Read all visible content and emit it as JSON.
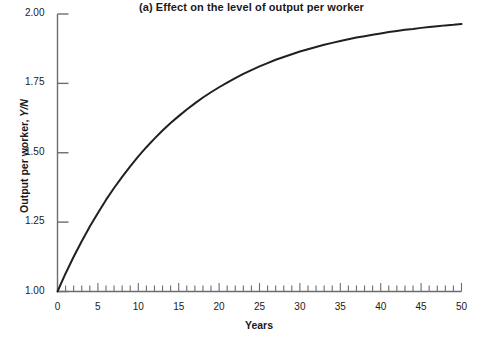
{
  "chart_data": {
    "type": "line",
    "title": "(a) Effect on the level of output per worker",
    "xlabel": "Years",
    "ylabel": "Output per worker, Y/N",
    "ylabel_plain": "Output per worker, ",
    "ylabel_italic": "Y/N",
    "xlim": [
      0,
      50
    ],
    "ylim": [
      1.0,
      2.0
    ],
    "grid": false,
    "legend": null,
    "xticks": [
      0,
      5,
      10,
      15,
      20,
      25,
      30,
      35,
      40,
      45,
      50
    ],
    "xtick_labels": [
      "0",
      "5",
      "10",
      "15",
      "20",
      "25",
      "30",
      "35",
      "40",
      "45",
      "50"
    ],
    "xminor_tick_step": 1,
    "yticks": [
      1.0,
      1.25,
      1.5,
      1.75,
      2.0
    ],
    "ytick_labels": [
      "1.00",
      "1.25",
      "1.50",
      "1.75",
      "2.00"
    ],
    "series": [
      {
        "name": "Output per worker",
        "color": "#231f20",
        "linewidth": 2,
        "x": [
          0,
          1,
          2,
          3,
          4,
          5,
          6,
          7,
          8,
          9,
          10,
          11,
          12,
          13,
          14,
          15,
          16,
          17,
          18,
          19,
          20,
          21,
          22,
          23,
          24,
          25,
          26,
          27,
          28,
          29,
          30,
          31,
          32,
          33,
          34,
          35,
          36,
          37,
          38,
          39,
          40,
          41,
          42,
          43,
          44,
          45,
          46,
          47,
          48,
          49,
          50
        ],
        "values": [
          1.0,
          1.065,
          1.125,
          1.181,
          1.234,
          1.283,
          1.33,
          1.373,
          1.413,
          1.451,
          1.487,
          1.52,
          1.551,
          1.58,
          1.607,
          1.632,
          1.656,
          1.678,
          1.699,
          1.718,
          1.736,
          1.753,
          1.769,
          1.784,
          1.798,
          1.811,
          1.823,
          1.835,
          1.845,
          1.855,
          1.865,
          1.873,
          1.881,
          1.889,
          1.896,
          1.903,
          1.909,
          1.915,
          1.92,
          1.925,
          1.93,
          1.935,
          1.939,
          1.943,
          1.946,
          1.95,
          1.953,
          1.956,
          1.959,
          1.961,
          1.964
        ]
      }
    ],
    "axis_color": "#6d6d6d",
    "background": "#ffffff"
  }
}
